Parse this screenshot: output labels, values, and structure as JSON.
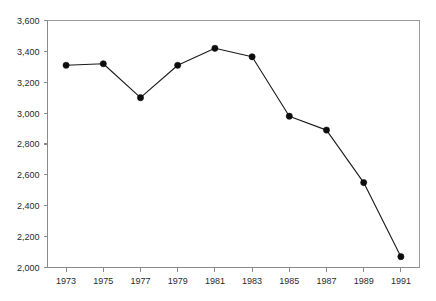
{
  "chart_data": {
    "type": "line",
    "title": "",
    "subtitle": "",
    "xlabel": "",
    "ylabel": "",
    "x": [
      1973,
      1975,
      1977,
      1979,
      1981,
      1983,
      1985,
      1987,
      1989,
      1991
    ],
    "values": [
      3310,
      3320,
      3100,
      3310,
      3420,
      3365,
      2980,
      2890,
      2550,
      2070
    ],
    "series": [
      {
        "name": "series-1",
        "values": [
          3310,
          3320,
          3100,
          3310,
          3420,
          3365,
          2980,
          2890,
          2550,
          2070
        ]
      }
    ],
    "xtick_labels": [
      "1973",
      "1975",
      "1977",
      "1979",
      "1981",
      "1983",
      "1985",
      "1987",
      "1989",
      "1991"
    ],
    "ytick_labels": [
      "2,000",
      "2,200",
      "2,400",
      "2,600",
      "2,800",
      "3,000",
      "3,200",
      "3,400",
      "3,600"
    ],
    "yticks": [
      2000,
      2200,
      2400,
      2600,
      2800,
      3000,
      3200,
      3400,
      3600
    ],
    "xlim": [
      1972,
      1992
    ],
    "ylim": [
      2000,
      3600
    ],
    "grid": false,
    "legend": false,
    "legend_position": "none",
    "marker": "filled-circle",
    "line_color": "#1a1a1a",
    "marker_color": "#0d0d0d",
    "axis_color": "#8a8a8a",
    "background": "#ffffff",
    "annotations": []
  }
}
